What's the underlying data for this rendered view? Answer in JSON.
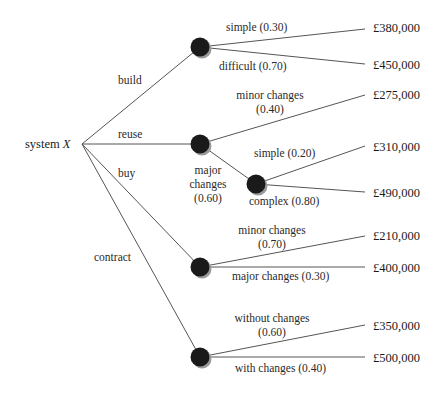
{
  "root": {
    "label": "system",
    "var": "X"
  },
  "options": [
    {
      "label": "build",
      "outcomes": [
        {
          "label": "simple (0.30)",
          "value": "£380,000"
        },
        {
          "label": "difficult (0.70)",
          "value": "£450,000"
        }
      ]
    },
    {
      "label": "reuse",
      "outcomes": [
        {
          "label_line1": "minor changes",
          "label_line2": "(0.40)",
          "value": "£275,000"
        },
        {
          "label_line1": "major",
          "label_line2": "changes",
          "label_line3": "(0.60)",
          "outcomes": [
            {
              "label": "simple (0.20)",
              "value": "£310,000"
            },
            {
              "label": "complex (0.80)",
              "value": "£490,000"
            }
          ]
        }
      ]
    },
    {
      "label": "buy",
      "outcomes": [
        {
          "label_line1": "minor changes",
          "label_line2": "(0.70)",
          "value": "£210,000"
        },
        {
          "label": "major changes (0.30)",
          "value": "£400,000"
        }
      ]
    },
    {
      "label": "contract",
      "outcomes": [
        {
          "label_line1": "without changes",
          "label_line2": "(0.60)",
          "value": "£350,000"
        },
        {
          "label": "with changes (0.40)",
          "value": "£500,000"
        }
      ]
    }
  ],
  "colors": {
    "line": "#555555",
    "node": "#1a1a1a",
    "node_shadow": "#9a9a9a"
  }
}
